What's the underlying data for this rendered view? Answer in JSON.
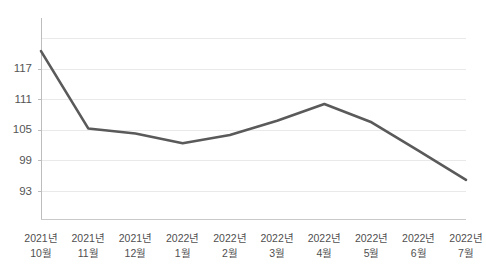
{
  "chart_data": {
    "type": "line",
    "title": "",
    "subtitle": "",
    "xlabel": "",
    "ylabel": "",
    "categories": [
      "2021년\n10월",
      "2021년\n11월",
      "2021년\n12월",
      "2022년\n1월",
      "2022년\n2월",
      "2022년\n3월",
      "2022년\n4월",
      "2022년\n5월",
      "2022년\n6월",
      "2022년\n7월"
    ],
    "category_lines": [
      [
        "2021년",
        "10월"
      ],
      [
        "2021년",
        "11월"
      ],
      [
        "2021년",
        "12월"
      ],
      [
        "2022년",
        "1월"
      ],
      [
        "2022년",
        "2월"
      ],
      [
        "2022년",
        "3월"
      ],
      [
        "2022년",
        "4월"
      ],
      [
        "2022년",
        "5월"
      ],
      [
        "2022년",
        "6월"
      ],
      [
        "2022년",
        "7월"
      ]
    ],
    "values": [
      120.5,
      105.3,
      104.3,
      102.4,
      104.0,
      106.8,
      110.1,
      106.5,
      100.9,
      95.2
    ],
    "series": [
      {
        "name": "",
        "color": "#5a5a5a",
        "values": [
          120.5,
          105.3,
          104.3,
          102.4,
          104.0,
          106.8,
          110.1,
          106.5,
          100.9,
          95.2
        ]
      }
    ],
    "ytick_labels": [
      "117",
      "111",
      "105",
      "99",
      "93"
    ],
    "ytick_values": [
      117,
      111,
      105,
      99,
      93
    ],
    "gridline_values": [
      123,
      117,
      111,
      105,
      99,
      93
    ],
    "ylim": [
      87.5,
      127
    ],
    "grid": true,
    "legend": false,
    "legend_position": "none",
    "colors": {
      "line": "#5a5a5a",
      "grid": "#e9e9e9",
      "axis": "#bdbdbd",
      "text": "#4f4f4f",
      "background": "#ffffff"
    },
    "plot_area": {
      "left": 41,
      "right": 466,
      "top": 18,
      "bottom": 219
    }
  }
}
